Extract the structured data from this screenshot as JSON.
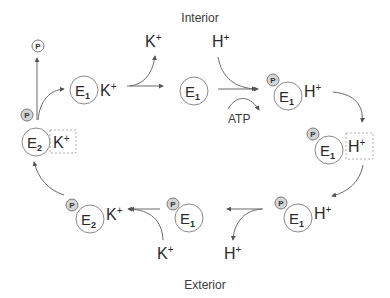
{
  "regions": {
    "interior": "Interior",
    "exterior": "Exterior"
  },
  "phosphate_symbol": "P",
  "atp_label": "ATP",
  "ions": {
    "k": "K",
    "h": "H",
    "charge": "+"
  },
  "enzymes": {
    "e1_letter": "E",
    "e1_sub": "1",
    "e2_letter": "E",
    "e2_sub": "2"
  },
  "states": [
    {
      "id": "e2-k-occluded",
      "enzyme": "E2",
      "ion": "K+",
      "phosphorylated": false,
      "occluded": true
    },
    {
      "id": "e1-k",
      "enzyme": "E1",
      "ion": "K+",
      "phosphorylated": false,
      "occluded": false
    },
    {
      "id": "e1",
      "enzyme": "E1",
      "ion": null,
      "phosphorylated": false,
      "occluded": false
    },
    {
      "id": "p-e1-h",
      "enzyme": "E1",
      "ion": "H+",
      "phosphorylated": true,
      "occluded": false
    },
    {
      "id": "p-e1-h-occluded",
      "enzyme": "E1",
      "ion": "H+",
      "phosphorylated": true,
      "occluded": true
    },
    {
      "id": "p-e1-h-exterior",
      "enzyme": "E1",
      "ion": "H+",
      "phosphorylated": true,
      "occluded": false
    },
    {
      "id": "p-e1",
      "enzyme": "E1",
      "ion": null,
      "phosphorylated": true,
      "occluded": false
    },
    {
      "id": "p-e2-k",
      "enzyme": "E2",
      "ion": "K+",
      "phosphorylated": true,
      "occluded": false
    }
  ],
  "colors": {
    "line": "#6a6a6a",
    "phosphate_fill": "#d4d4d4",
    "text": "#2a2a2a"
  }
}
